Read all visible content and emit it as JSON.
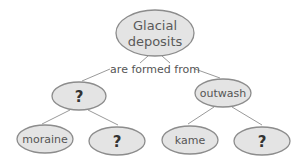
{
  "diagram": {
    "type": "concept-map",
    "root": {
      "line1": "Glacial",
      "line2": "deposits"
    },
    "link_label": "are formed from",
    "level2": [
      {
        "label": "?"
      },
      {
        "label": "outwash"
      }
    ],
    "level3": [
      {
        "label": "moraine"
      },
      {
        "label": "?"
      },
      {
        "label": "kame"
      },
      {
        "label": "?"
      }
    ],
    "colors": {
      "node_fill": "#e4e4e4",
      "node_stroke": "#8c8c8c",
      "edge": "#9a9a9a",
      "text": "#555555"
    }
  }
}
